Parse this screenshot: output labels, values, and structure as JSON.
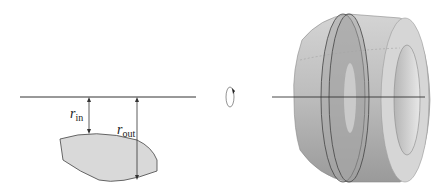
{
  "figure": {
    "left_panel": {
      "labels": {
        "r_in": {
          "main": "r",
          "sub": "in"
        },
        "r_out": {
          "main": "r",
          "sub": "out"
        }
      },
      "region_fill": "#d9d9d9",
      "stroke": "#333333"
    },
    "middle": {
      "icon": "rotation-arrow-icon"
    },
    "right_panel": {
      "solid_fill": "#bdbdbd",
      "cross_section_fill": "#9e9e9e",
      "hole_fill": "#e0e0e0"
    }
  }
}
